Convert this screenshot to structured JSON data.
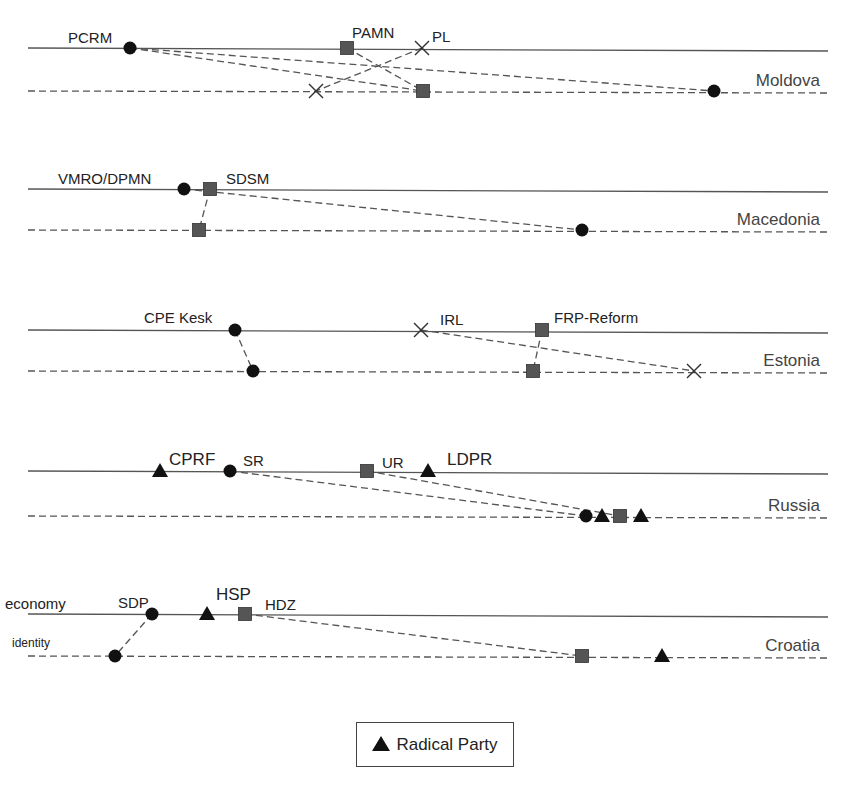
{
  "chart_data": {
    "type": "diagram",
    "axes": {
      "economy_label": "economy",
      "identity_label": "identity"
    },
    "legend": [
      {
        "marker": "triangle",
        "label": "Radical Party"
      }
    ],
    "countries": [
      {
        "name": "Moldova",
        "econ_y": 48,
        "id_y": 91,
        "parties": [
          {
            "name": "PCRM",
            "marker": "circle",
            "econ_x": 130,
            "id_x": 714,
            "label_x": 68,
            "label_y": 43,
            "font": 15
          },
          {
            "name": "PAMN",
            "marker": "square",
            "econ_x": 347,
            "id_x": 423,
            "label_x": 352,
            "label_y": 38,
            "font": 15
          },
          {
            "name": "PL",
            "marker": "x",
            "econ_x": 422,
            "id_x": 316,
            "label_x": 432,
            "label_y": 42,
            "font": 15
          }
        ],
        "extra_links": [
          {
            "from_x": 130,
            "to_x": 423
          }
        ]
      },
      {
        "name": "Macedonia",
        "econ_y": 189,
        "id_y": 230,
        "parties": [
          {
            "name": "VMRO/DPMN",
            "marker": "circle",
            "econ_x": 184,
            "id_x": 582,
            "label_x": 58,
            "label_y": 184,
            "font": 15
          },
          {
            "name": "SDSM",
            "marker": "square",
            "econ_x": 210,
            "id_x": 199,
            "label_x": 226,
            "label_y": 184,
            "font": 15
          }
        ],
        "extra_links": []
      },
      {
        "name": "Estonia",
        "econ_y": 330,
        "id_y": 371,
        "parties": [
          {
            "name": "CPE Kesk",
            "marker": "circle",
            "econ_x": 235,
            "id_x": 253,
            "label_x": 144,
            "label_y": 323,
            "font": 15
          },
          {
            "name": "IRL",
            "marker": "x",
            "econ_x": 421,
            "id_x": 694,
            "label_x": 440,
            "label_y": 325,
            "font": 15
          },
          {
            "name": "FRP-Reform",
            "marker": "square",
            "econ_x": 542,
            "id_x": 533,
            "label_x": 554,
            "label_y": 323,
            "font": 15
          }
        ],
        "extra_links": []
      },
      {
        "name": "Russia",
        "econ_y": 471,
        "id_y": 516,
        "parties": [
          {
            "name": "CPRF",
            "marker": "triangle",
            "econ_x": 160,
            "id_x": 602,
            "label_x": 169,
            "label_y": 465,
            "font": 17
          },
          {
            "name": "SR",
            "marker": "circle",
            "econ_x": 230,
            "id_x": 586,
            "label_x": 243,
            "label_y": 466,
            "font": 15
          },
          {
            "name": "UR",
            "marker": "square",
            "econ_x": 367,
            "id_x": 620,
            "label_x": 382,
            "label_y": 468,
            "font": 15
          },
          {
            "name": "LDPR",
            "marker": "triangle",
            "econ_x": 428,
            "id_x": 641,
            "label_x": 447,
            "label_y": 465,
            "font": 17
          }
        ],
        "links_shown": [
          "SR",
          "UR"
        ],
        "extra_links": []
      },
      {
        "name": "Croatia",
        "econ_y": 614,
        "id_y": 656,
        "parties": [
          {
            "name": "SDP",
            "marker": "circle",
            "econ_x": 152,
            "id_x": 115,
            "label_x": 118,
            "label_y": 608,
            "font": 15
          },
          {
            "name": "HSP",
            "marker": "triangle",
            "econ_x": 207,
            "id_x": 662,
            "label_x": 216,
            "label_y": 600,
            "font": 17
          },
          {
            "name": "HDZ",
            "marker": "square",
            "econ_x": 245,
            "id_x": 582,
            "label_x": 265,
            "label_y": 610,
            "font": 15
          }
        ],
        "links_shown": [
          "SDP",
          "HDZ"
        ],
        "extra_links": []
      }
    ]
  },
  "line_extent": {
    "x_start": 28,
    "x_end": 828
  },
  "country_label_x": 820
}
